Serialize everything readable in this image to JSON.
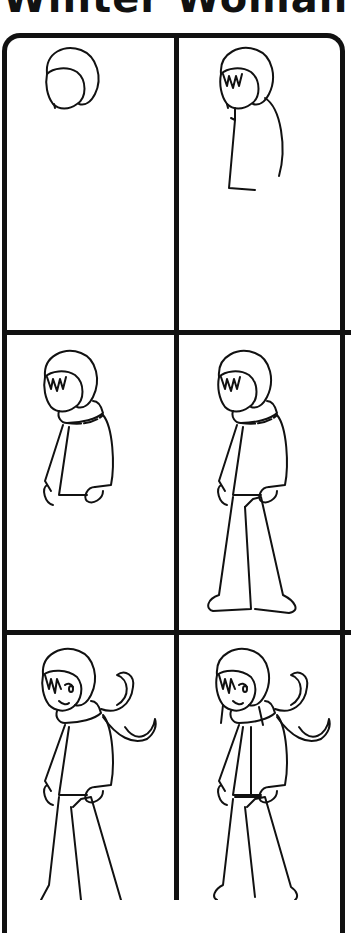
{
  "title": "Winter Woman",
  "panels": [
    {
      "step": 1,
      "description": "hood and head outline"
    },
    {
      "step": 2,
      "description": "bangs and body outline"
    },
    {
      "step": 3,
      "description": "scarf, jacket and mittens"
    },
    {
      "step": 4,
      "description": "legs and boots"
    },
    {
      "step": 5,
      "description": "face and flowing scarf"
    },
    {
      "step": 6,
      "description": "final details"
    }
  ],
  "colors": {
    "ink": "#111111",
    "paper": "#ffffff"
  }
}
